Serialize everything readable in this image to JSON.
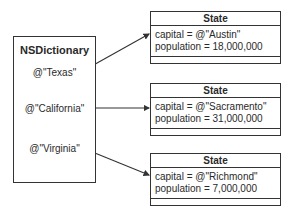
{
  "dictionary": {
    "title": "NSDictionary",
    "keys": [
      "@\"Texas\"",
      "@\"California\"",
      "@\"Virginia\""
    ]
  },
  "states": [
    {
      "title": "State",
      "capital": "capital =  @\"Austin\"",
      "population": "population = 18,000,000"
    },
    {
      "title": "State",
      "capital": "capital =  @\"Sacramento\"",
      "population": "population = 31,000,000"
    },
    {
      "title": "State",
      "capital": "capital =  @\"Richmond\"",
      "population": "population = 7,000,000"
    }
  ],
  "colors": {
    "line": "#333333",
    "text": "#2a2a2a",
    "background": "#ffffff"
  }
}
